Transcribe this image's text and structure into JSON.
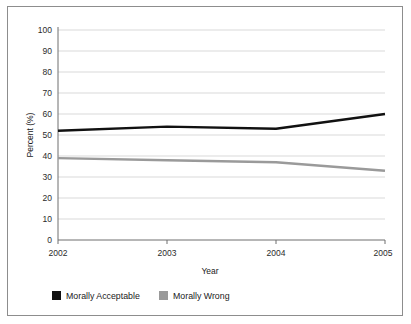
{
  "chart_data": {
    "type": "line",
    "title": "",
    "subtitle": "",
    "xlabel": "Year",
    "ylabel": "Percent (%)",
    "categories": [
      "2002",
      "2003",
      "2004",
      "2005"
    ],
    "x": [
      2002,
      2003,
      2004,
      2005
    ],
    "xlim": [
      2002,
      2005
    ],
    "ylim": [
      0,
      100
    ],
    "ytick_step": 10,
    "yticks": [
      0,
      10,
      20,
      30,
      40,
      50,
      60,
      70,
      80,
      90,
      100
    ],
    "ytick_labels": [
      "0",
      "10",
      "20",
      "30",
      "40",
      "50",
      "60",
      "70",
      "80",
      "90",
      "100"
    ],
    "xticks": [
      2002,
      2003,
      2004,
      2005
    ],
    "xtick_labels": [
      "2002",
      "2003",
      "2004",
      "2005"
    ],
    "grid": "horizontal",
    "legend_position": "below-bottom-left",
    "series": [
      {
        "name": "Morally Acceptable",
        "color": "#111111",
        "values": [
          52,
          54,
          53,
          60
        ]
      },
      {
        "name": "Morally Wrong",
        "color": "#9a9a9a",
        "values": [
          39,
          38,
          37,
          33
        ]
      }
    ]
  },
  "legend": {
    "items": [
      {
        "label": "Morally Acceptable",
        "swatch": "#111111"
      },
      {
        "label": "Morally Wrong",
        "swatch": "#9a9a9a"
      }
    ]
  },
  "colors": {
    "frame": "#8d8d8d",
    "grid": "#cfcfcf",
    "axis": "#6e6e6e",
    "background": "#ffffff",
    "series_acceptable": "#111111",
    "series_wrong": "#9a9a9a"
  }
}
